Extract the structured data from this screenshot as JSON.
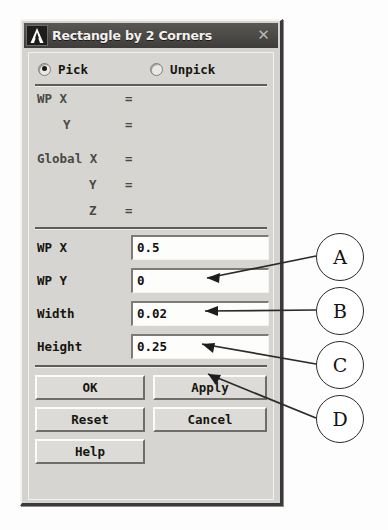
{
  "window": {
    "title": "Rectangle by 2 Corners",
    "logo_icon": "ansys-a-logo-icon",
    "close_icon": "✕"
  },
  "mode": {
    "options": [
      {
        "label": "Pick",
        "selected": true
      },
      {
        "label": "Unpick",
        "selected": false
      }
    ]
  },
  "readout": {
    "rows": [
      {
        "label": "WP X",
        "equals": "=",
        "value": ""
      },
      {
        "label": "Y",
        "equals": "=",
        "value": ""
      },
      {
        "label": "Global X",
        "equals": "=",
        "value": ""
      },
      {
        "label": "Y",
        "equals": "=",
        "value": ""
      },
      {
        "label": "Z",
        "equals": "=",
        "value": ""
      }
    ]
  },
  "fields": [
    {
      "label": "WP X",
      "value": "0.5"
    },
    {
      "label": "WP Y",
      "value": "0"
    },
    {
      "label": "Width",
      "value": "0.02"
    },
    {
      "label": "Height",
      "value": "0.25"
    }
  ],
  "buttons": [
    {
      "label": "OK"
    },
    {
      "label": "Apply"
    },
    {
      "label": "Reset"
    },
    {
      "label": "Cancel"
    },
    {
      "label": "Help"
    }
  ],
  "annotations": [
    {
      "label": "A",
      "points_to": "WP X"
    },
    {
      "label": "B",
      "points_to": "WP Y"
    },
    {
      "label": "C",
      "points_to": "Width"
    },
    {
      "label": "D",
      "points_to": "Height"
    }
  ],
  "colors": {
    "dialog_face": "#d4d3cf",
    "titlebar": "#4a4946",
    "title_text": "#f2f1ee",
    "field_bg": "#fdfdfb",
    "text": "#16160f",
    "readout_text": "#4a4a45",
    "annotation_stroke": "#2b2b2b"
  }
}
